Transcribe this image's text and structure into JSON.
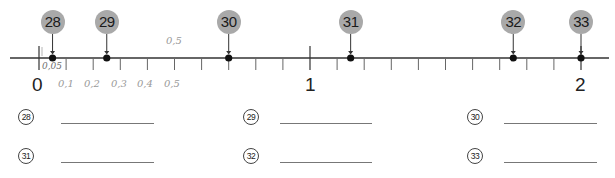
{
  "header": {
    "fragment": "у"
  },
  "number_line": {
    "min_label": "0",
    "mid_label": "1",
    "max_label": "2",
    "range": [
      0,
      2
    ],
    "minor_step": 0.1,
    "line_color": "#333333",
    "bubble_color": "#a9a9a9",
    "points": [
      {
        "id": "28",
        "label": "28",
        "value": 0.05
      },
      {
        "id": "29",
        "label": "29",
        "value": 0.25
      },
      {
        "id": "30",
        "label": "30",
        "value": 0.7
      },
      {
        "id": "31",
        "label": "31",
        "value": 1.15
      },
      {
        "id": "32",
        "label": "32",
        "value": 1.75
      },
      {
        "id": "33",
        "label": "33",
        "value": 2.0
      }
    ]
  },
  "pencil_notes": {
    "above_half": "0,5",
    "first_point": "0,05",
    "below": [
      "0,1",
      "0,2",
      "0,3",
      "0,4",
      "0,5"
    ]
  },
  "answers": {
    "rows": [
      [
        {
          "label": "28",
          "value": ""
        },
        {
          "label": "29",
          "value": ""
        },
        {
          "label": "30",
          "value": ""
        }
      ],
      [
        {
          "label": "31",
          "value": ""
        },
        {
          "label": "32",
          "value": ""
        },
        {
          "label": "33",
          "value": ""
        }
      ]
    ]
  }
}
